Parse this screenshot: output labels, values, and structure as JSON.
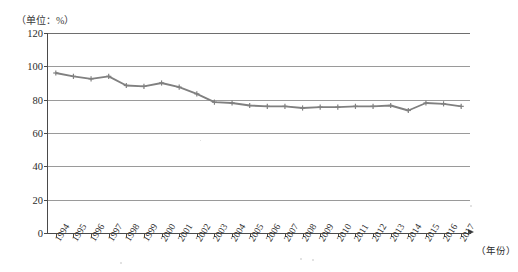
{
  "chart_data": {
    "type": "line",
    "title": "",
    "unit_label": "（单位：%）",
    "xlabel": "（年份）",
    "ylabel": "",
    "ylim": [
      0,
      120
    ],
    "yticks": [
      0,
      20,
      40,
      60,
      80,
      100,
      120
    ],
    "grid": true,
    "legend": "none",
    "line_color": "#808080",
    "marker": "plus",
    "categories": [
      "1994",
      "1995",
      "1996",
      "1997",
      "1998",
      "1999",
      "2000",
      "2001",
      "2002",
      "2003",
      "2004",
      "2005",
      "2006",
      "2007",
      "2008",
      "2009",
      "2010",
      "2011",
      "2012",
      "2013",
      "2014",
      "2015",
      "2016",
      "2017"
    ],
    "values": [
      96.0,
      94.0,
      92.5,
      94.0,
      88.5,
      88.0,
      90.0,
      87.5,
      83.5,
      78.5,
      78.0,
      76.5,
      76.0,
      76.0,
      75.0,
      75.5,
      75.5,
      76.0,
      76.0,
      76.5,
      73.5,
      78.0,
      77.5,
      76.0
    ]
  },
  "axes": {
    "y_tick_labels": [
      "120",
      "100",
      "80",
      "60",
      "40",
      "20",
      "0"
    ],
    "x_axis_caption": "（年份）"
  }
}
